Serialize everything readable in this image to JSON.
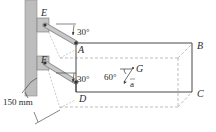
{
  "figure": {
    "points": {
      "E": "E",
      "A": "A",
      "F": "F",
      "D": "D",
      "B": "B",
      "C": "C",
      "G": "G"
    },
    "angles": {
      "upper_link": "30°",
      "lower_link": "30°",
      "acceleration": "60°"
    },
    "acceleration_label": "a",
    "dimension": "150 mm"
  },
  "colors": {
    "wall": "#b9b9b9",
    "link": "#a9a9a9",
    "line": "#3a3a3a",
    "dashed": "#9a9a9a"
  }
}
